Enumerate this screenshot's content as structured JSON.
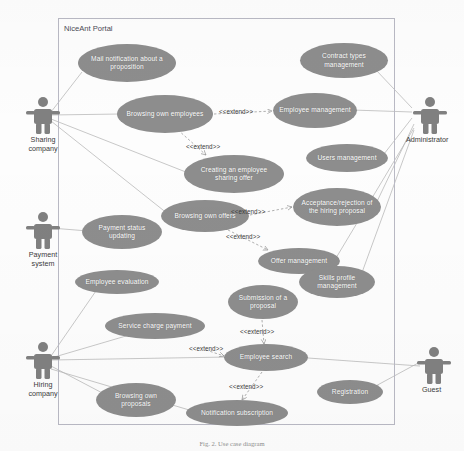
{
  "diagram": {
    "caption": "Fig. 2. Use case diagram",
    "boundary_title": "NiceAnt Portal",
    "stereotype_label": "<<extend>>",
    "colors": {
      "usecase_fill": "#8d8d8d",
      "usecase_text": "#ffffff",
      "boundary_border": "#b9b9c4",
      "actor_fill": "#808080",
      "link_line": "#b0b0b0",
      "text": "#3a3a3a"
    },
    "actors": [
      {
        "id": "sharing-company",
        "label": "Sharing\ncompany",
        "x": 16,
        "y": 95
      },
      {
        "id": "payment-system",
        "label": "Payment\nsystem",
        "x": 16,
        "y": 210
      },
      {
        "id": "hiring-company",
        "label": "Hiring\ncompany",
        "x": 16,
        "y": 340
      },
      {
        "id": "administrator",
        "label": "Administrator",
        "x": 404,
        "y": 95
      },
      {
        "id": "guest",
        "label": "Guest",
        "x": 410,
        "y": 345
      }
    ],
    "use_cases": [
      {
        "id": "mail-notification-about-a-proposition",
        "label": "Mail notification about a proposition",
        "x": 78,
        "y": 44,
        "w": 98,
        "h": 38
      },
      {
        "id": "contract-types-management",
        "label": "Contract types management",
        "x": 300,
        "y": 43,
        "w": 88,
        "h": 35
      },
      {
        "id": "browsing-own-employees",
        "label": "Browsing own employees",
        "x": 117,
        "y": 95,
        "w": 96,
        "h": 38
      },
      {
        "id": "employee-management",
        "label": "Employee management",
        "x": 273,
        "y": 93,
        "w": 84,
        "h": 35
      },
      {
        "id": "users-management",
        "label": "Users management",
        "x": 306,
        "y": 144,
        "w": 82,
        "h": 28
      },
      {
        "id": "creating-an-employee-sharing-offer",
        "label": "Creating an employee sharing offer",
        "x": 184,
        "y": 155,
        "w": 100,
        "h": 38
      },
      {
        "id": "acceptance-rejection-of-the-hiring-proposal",
        "label": "Acceptance/rejection of the hiring proposal",
        "x": 293,
        "y": 188,
        "w": 88,
        "h": 38
      },
      {
        "id": "browsing-own-offers",
        "label": "Browsing own offers",
        "x": 161,
        "y": 200,
        "w": 88,
        "h": 32
      },
      {
        "id": "payment-status-updating",
        "label": "Payment status updating",
        "x": 82,
        "y": 215,
        "w": 80,
        "h": 34
      },
      {
        "id": "offer-management",
        "label": "Offer management",
        "x": 258,
        "y": 248,
        "w": 82,
        "h": 26
      },
      {
        "id": "skills-profile-management",
        "label": "Skills profile management",
        "x": 299,
        "y": 266,
        "w": 76,
        "h": 32
      },
      {
        "id": "employee-evaluation",
        "label": "Employee evaluation",
        "x": 75,
        "y": 270,
        "w": 84,
        "h": 24
      },
      {
        "id": "submission-of-a-proposal",
        "label": "Submission of a proposal",
        "x": 228,
        "y": 285,
        "w": 70,
        "h": 34
      },
      {
        "id": "service-charge-payment",
        "label": "Service charge payment",
        "x": 105,
        "y": 313,
        "w": 100,
        "h": 26
      },
      {
        "id": "employee-search",
        "label": "Employee search",
        "x": 224,
        "y": 344,
        "w": 84,
        "h": 27
      },
      {
        "id": "registration",
        "label": "Registration",
        "x": 317,
        "y": 380,
        "w": 66,
        "h": 24
      },
      {
        "id": "browsing-own-proposals",
        "label": "Browsing own proposals",
        "x": 96,
        "y": 383,
        "w": 80,
        "h": 34
      },
      {
        "id": "notification-subscription",
        "label": "Notification subscription",
        "x": 186,
        "y": 400,
        "w": 102,
        "h": 26
      }
    ],
    "extend_labels": [
      {
        "id": "extend-browsing-employees-to-employee-mgmt",
        "x": 219,
        "y": 108
      },
      {
        "id": "extend-browsing-employees-to-creating-offer",
        "x": 186,
        "y": 143
      },
      {
        "id": "extend-browsing-offers-to-acceptance",
        "x": 231,
        "y": 208
      },
      {
        "id": "extend-browsing-offers-to-offer-mgmt",
        "x": 226,
        "y": 233
      },
      {
        "id": "extend-submission-to-employee-search",
        "x": 240,
        "y": 328
      },
      {
        "id": "extend-service-charge-to-employee-search",
        "x": 189,
        "y": 345
      },
      {
        "id": "extend-employee-search-to-notification",
        "x": 229,
        "y": 383
      }
    ]
  }
}
